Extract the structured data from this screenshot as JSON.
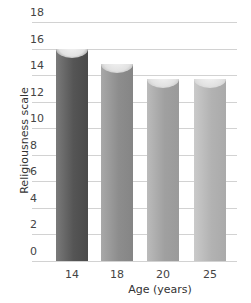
{
  "chart_data": {
    "type": "bar",
    "title": "",
    "xlabel": "Age (years)",
    "ylabel": "Religiousness scale",
    "categories": [
      "14",
      "18",
      "20",
      "25"
    ],
    "values": [
      16,
      14.8,
      13.7,
      13.7
    ],
    "ylim": [
      0,
      18
    ],
    "yticks": [
      "0",
      "2",
      "4",
      "6",
      "8",
      "10",
      "12",
      "14",
      "16",
      "18"
    ],
    "grid": true,
    "legend": null,
    "bar_colors": [
      "#6e6e6e",
      "#9a9a9a",
      "#acacac",
      "#bdbdbd"
    ]
  }
}
